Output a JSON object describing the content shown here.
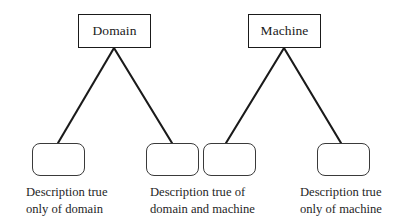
{
  "figure": {
    "type": "tree-diagram",
    "background_color": "#ffffff",
    "line_color": "#1a1a1a",
    "text_color": "#1a1a1a"
  },
  "nodes": {
    "top": [
      {
        "id": "domain",
        "label": "Domain",
        "shape": "rectangle"
      },
      {
        "id": "machine",
        "label": "Machine",
        "shape": "rectangle"
      }
    ],
    "leaves": [
      {
        "id": "leaf-domain-only",
        "label": "",
        "shape": "rounded-rectangle"
      },
      {
        "id": "leaf-shared-left",
        "label": "",
        "shape": "rounded-rectangle"
      },
      {
        "id": "leaf-shared-right",
        "label": "",
        "shape": "rounded-rectangle"
      },
      {
        "id": "leaf-machine-only",
        "label": "",
        "shape": "rounded-rectangle"
      }
    ]
  },
  "captions": [
    {
      "id": "caption-domain-only",
      "line1": "Description true",
      "line2": "only of domain"
    },
    {
      "id": "caption-shared",
      "line1": "Description true of",
      "line2": "domain and machine"
    },
    {
      "id": "caption-machine-only",
      "line1": "Description true",
      "line2": "only of machine"
    }
  ]
}
